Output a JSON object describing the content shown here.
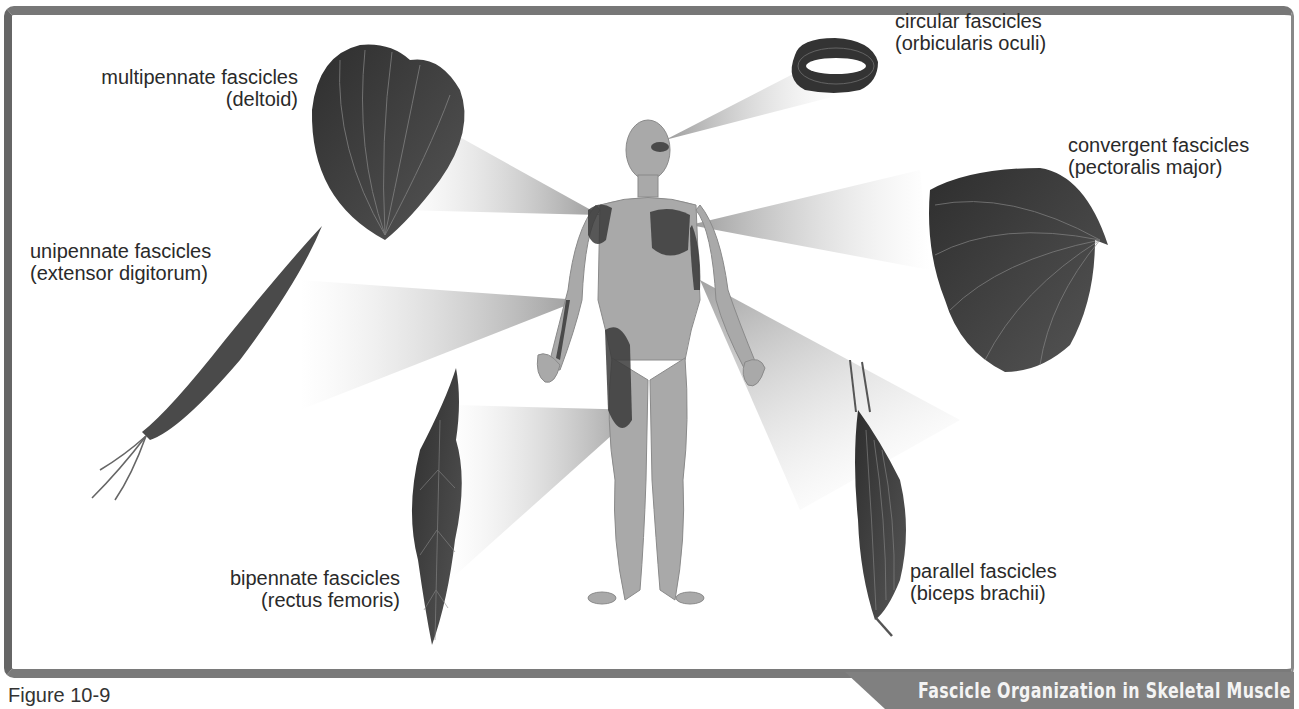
{
  "figure": {
    "number": "Figure 10-9",
    "title": "Fascicle Organization in Skeletal Muscle"
  },
  "labels": {
    "multipennate": {
      "type": "multipennate fascicles",
      "example": "(deltoid)"
    },
    "circular": {
      "type": "circular fascicles",
      "example": "(orbicularis oculi)"
    },
    "convergent": {
      "type": "convergent fascicles",
      "example": "(pectoralis major)"
    },
    "unipennate": {
      "type": "unipennate fascicles",
      "example": "(extensor digitorum)"
    },
    "bipennate": {
      "type": "bipennate fascicles",
      "example": "(rectus femoris)"
    },
    "parallel": {
      "type": "parallel fascicles",
      "example": "(biceps brachii)"
    }
  },
  "colors": {
    "frame": "#777777",
    "muscle": "#3e3e3e",
    "figure_body": "#a8a8a8",
    "title_bar": "#808080",
    "title_text": "#f4f4f4"
  }
}
